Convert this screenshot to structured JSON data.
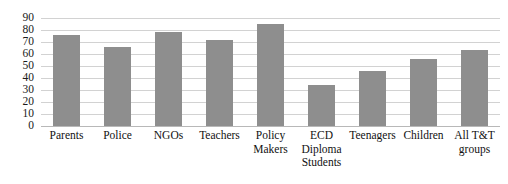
{
  "chart_data": {
    "type": "bar",
    "title": "",
    "xlabel": "",
    "ylabel": "",
    "ylim": [
      0,
      90
    ],
    "grid": true,
    "legend": "none",
    "categories": [
      "Parents",
      "Police",
      "NGOs",
      "Teachers",
      "Policy Makers",
      "ECD Diploma Students",
      "Teenagers",
      "Children",
      "All T&T groups"
    ],
    "category_lines": [
      [
        "Parents"
      ],
      [
        "Police"
      ],
      [
        "NGOs"
      ],
      [
        "Teachers"
      ],
      [
        "Policy",
        "Makers"
      ],
      [
        "ECD",
        "Diploma",
        "Students"
      ],
      [
        "Teenagers"
      ],
      [
        "Children"
      ],
      [
        "All T&T",
        "groups"
      ]
    ],
    "values": [
      76,
      66,
      78,
      72,
      85,
      34,
      46,
      56,
      63
    ],
    "y_ticks": [
      90,
      80,
      70,
      60,
      50,
      40,
      30,
      20,
      10,
      0
    ],
    "colors": {
      "bar": "#8e8e8e",
      "gridline": "#d2d2d2",
      "baseline": "#b8b8b8",
      "text": "#111111",
      "background": "#ffffff"
    }
  }
}
